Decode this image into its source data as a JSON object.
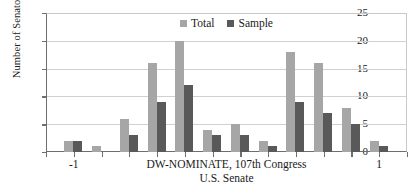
{
  "chart_data": {
    "type": "bar",
    "title": "",
    "xlabel": "DW-NOMINATE, 107th Congress",
    "xlabel_line2": "U.S. Senate",
    "ylabel": "Number of Senators",
    "ylim": [
      0,
      25
    ],
    "yticks": [
      0,
      5,
      10,
      15,
      20,
      25
    ],
    "ytick_labels": [
      "0",
      "5",
      "10",
      "15",
      "20",
      "25"
    ],
    "xtick_labels": [
      "-1",
      "1"
    ],
    "xtick_label_left": "-1",
    "xtick_label_right": "1",
    "grid": true,
    "legend_position": "top-center",
    "categories": [
      "b1",
      "b2",
      "b3",
      "b4",
      "b5",
      "b6",
      "b7",
      "b8",
      "b9",
      "b10",
      "b11",
      "b12"
    ],
    "series": [
      {
        "name": "Total",
        "color": "#a6a6a6",
        "values": [
          2,
          1,
          6,
          16,
          20,
          4,
          5,
          2,
          18,
          16,
          8,
          2
        ]
      },
      {
        "name": "Sample",
        "color": "#595959",
        "values": [
          2,
          0,
          3,
          9,
          12,
          3,
          3,
          1,
          9,
          7,
          5,
          1
        ]
      }
    ],
    "n_xticks": 13
  },
  "legend": {
    "items": [
      {
        "label": "Total",
        "color": "#a6a6a6"
      },
      {
        "label": "Sample",
        "color": "#595959"
      }
    ]
  }
}
